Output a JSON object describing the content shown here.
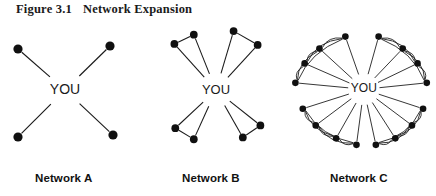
{
  "figure": {
    "number": "Figure 3.1",
    "title": "Network Expansion"
  },
  "center_label": "YOU",
  "panels": [
    {
      "id": "network-a",
      "label": "Network A",
      "center_label": "YOU",
      "node_count": 4,
      "description": "Four contacts linked directly to YOU in an X pattern, no links among contacts."
    },
    {
      "id": "network-b",
      "label": "Network B",
      "center_label": "YOU",
      "node_count": 8,
      "description": "Eight contacts arranged as four pairs; each node links to YOU and to its pair partner."
    },
    {
      "id": "network-c",
      "label": "Network C",
      "center_label": "YOU",
      "node_count": 16,
      "description": "Sixteen contacts in a dense ring; all link to YOU plus many curved cross links within four clusters."
    }
  ],
  "colors": {
    "ink": "#1a1a1a",
    "node": "#101010",
    "background": "#ffffff"
  },
  "chart_data": {
    "type": "diagram",
    "title": "Network Expansion",
    "panels": [
      {
        "name": "Network A",
        "hub": "YOU",
        "hub_xy": [
          65,
          72
        ],
        "nodes": [
          [
            18,
            31
          ],
          [
            110,
            28
          ],
          [
            18,
            119
          ],
          [
            113,
            117
          ]
        ],
        "hub_edges": [
          0,
          1,
          2,
          3
        ],
        "peer_edges": []
      },
      {
        "name": "Network B",
        "hub": "YOU",
        "hub_xy": [
          80,
          72
        ],
        "nodes": [
          [
            35,
            22
          ],
          [
            56,
            12
          ],
          [
            99,
            8
          ],
          [
            125,
            23
          ],
          [
            36,
            113
          ],
          [
            56,
            125
          ],
          [
            109,
            123
          ],
          [
            128,
            110
          ]
        ],
        "hub_edges": [
          0,
          1,
          2,
          3,
          4,
          5,
          6,
          7
        ],
        "peer_edges": [
          [
            0,
            1
          ],
          [
            2,
            3
          ],
          [
            4,
            5
          ],
          [
            6,
            7
          ]
        ]
      },
      {
        "name": "Network C",
        "hub": "YOU",
        "hub_xy": [
          82,
          71
        ],
        "nodes": [
          [
            62,
            14
          ],
          [
            34,
            27
          ],
          [
            18,
            43
          ],
          [
            8,
            64
          ],
          [
            16,
            92
          ],
          [
            30,
            110
          ],
          [
            52,
            124
          ],
          [
            74,
            131
          ],
          [
            95,
            131
          ],
          [
            116,
            124
          ],
          [
            134,
            110
          ],
          [
            146,
            92
          ],
          [
            150,
            64
          ],
          [
            140,
            43
          ],
          [
            124,
            27
          ],
          [
            98,
            14
          ]
        ],
        "hub_edges": [
          0,
          1,
          2,
          3,
          4,
          5,
          6,
          7,
          8,
          9,
          10,
          11,
          12,
          13,
          14,
          15
        ],
        "peer_edges": [
          [
            0,
            1
          ],
          [
            1,
            2
          ],
          [
            2,
            3
          ],
          [
            0,
            2
          ],
          [
            0,
            3
          ],
          [
            1,
            3
          ],
          [
            4,
            5
          ],
          [
            5,
            6
          ],
          [
            6,
            7
          ],
          [
            4,
            6
          ],
          [
            4,
            7
          ],
          [
            5,
            7
          ],
          [
            8,
            9
          ],
          [
            9,
            10
          ],
          [
            10,
            11
          ],
          [
            8,
            10
          ],
          [
            8,
            11
          ],
          [
            9,
            11
          ],
          [
            12,
            13
          ],
          [
            13,
            14
          ],
          [
            14,
            15
          ],
          [
            12,
            14
          ],
          [
            12,
            15
          ],
          [
            13,
            15
          ]
        ],
        "curved_edges": true
      }
    ]
  }
}
